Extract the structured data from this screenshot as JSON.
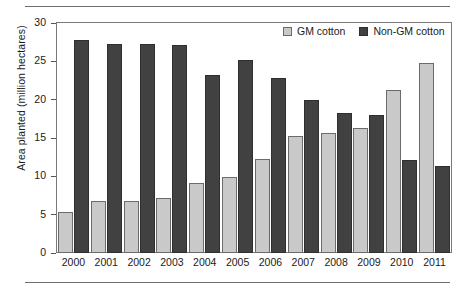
{
  "chart_data": {
    "type": "bar",
    "title": "",
    "xlabel": "",
    "ylabel": "Area planted (million hectares)",
    "ylim": [
      0,
      30
    ],
    "yticks": [
      0,
      5,
      10,
      15,
      20,
      25,
      30
    ],
    "grid": false,
    "legend_position": "top-right",
    "categories": [
      "2000",
      "2001",
      "2002",
      "2003",
      "2004",
      "2005",
      "2006",
      "2007",
      "2008",
      "2009",
      "2010",
      "2011"
    ],
    "series": [
      {
        "name": "GM cotton",
        "color": "#c9c9c9",
        "values": [
          5.3,
          6.8,
          6.8,
          7.2,
          9.1,
          9.9,
          12.3,
          15.2,
          15.6,
          16.3,
          21.2,
          24.8
        ]
      },
      {
        "name": "Non-GM cotton",
        "color": "#414141",
        "values": [
          27.8,
          27.2,
          27.2,
          27.1,
          23.2,
          25.2,
          22.8,
          20.0,
          18.3,
          18.0,
          12.1,
          11.4
        ]
      }
    ]
  }
}
